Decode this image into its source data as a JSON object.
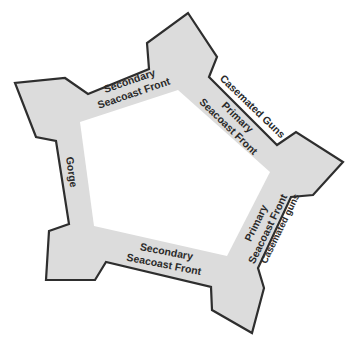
{
  "diagram": {
    "type": "fort-plan",
    "colors": {
      "rampart_fill": "#dcdcdc",
      "outline": "#2e2e2e",
      "parade_fill": "#ffffff",
      "text": "#2a2a2a",
      "background": "#ffffff"
    },
    "labels": {
      "secondary_front_top_line1": "Secondary",
      "secondary_front_top_line2": "Seacoast Front",
      "casemated_guns_top": "Casemated Guns",
      "primary_front_top_line1": "Primary",
      "primary_front_top_line2": "Seacoast Front",
      "gorge": "Gorge",
      "primary_front_right_line1": "Primary",
      "primary_front_right_line2": "Seacoast Front",
      "casemated_guns_right": "Casemated guns",
      "secondary_front_bottom_line1": "Secondary",
      "secondary_front_bottom_line2": "Seacoast Front"
    }
  }
}
